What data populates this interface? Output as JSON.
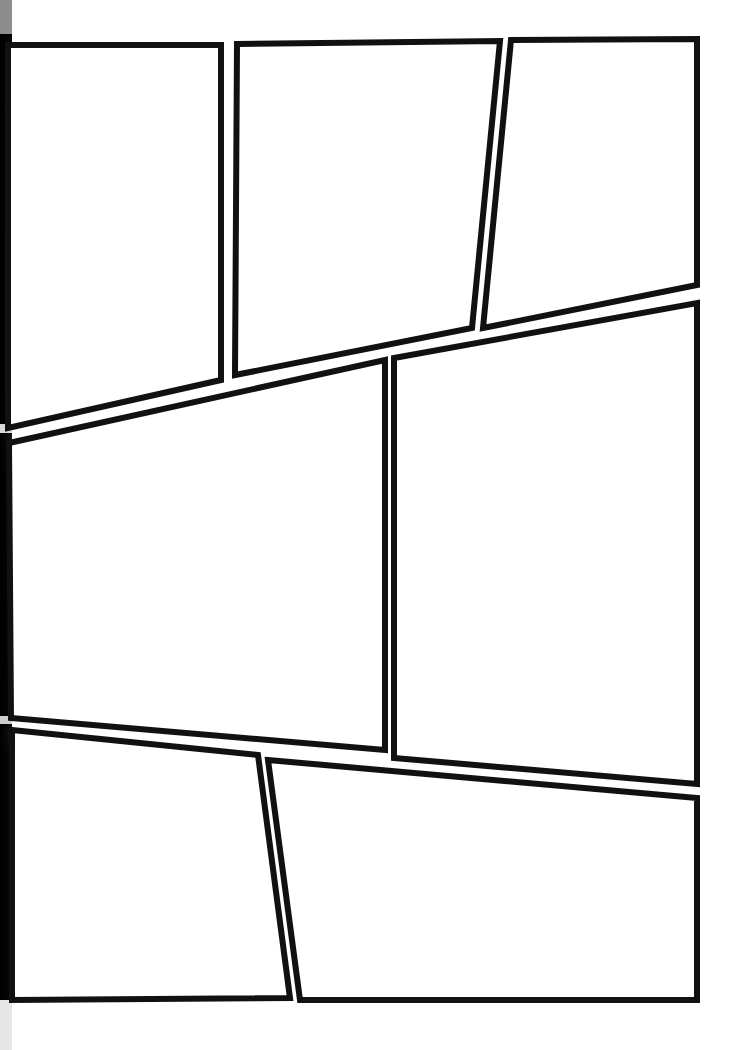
{
  "document": {
    "kind": "comic-page-template",
    "title": "Blank Comic Page Layout",
    "page_width": 744,
    "page_height": 1050,
    "background_color": "#ffffff",
    "ink_color": "#111111",
    "border_width": 6,
    "has_visible_text": false
  },
  "binding": {
    "name": "book-spine-shadow",
    "edge": "left",
    "x": 0,
    "width": 12,
    "top_color": "#0a0a0a",
    "bottom_color": "#1a1a1a"
  },
  "layout": {
    "tiers": 3,
    "panel_count": 7,
    "tier_labels": [
      "top-tier",
      "middle-tier",
      "bottom-tier"
    ]
  },
  "panels": [
    {
      "id": "panel-1",
      "label": "Panel 1",
      "tier": "top-tier",
      "order": 1,
      "points": "8,45 221,45 221,380 8,428"
    },
    {
      "id": "panel-2",
      "label": "Panel 2",
      "tier": "top-tier",
      "order": 2,
      "points": "237,44 500,41 472,328 235,375"
    },
    {
      "id": "panel-3",
      "label": "Panel 3",
      "tier": "top-tier",
      "order": 3,
      "points": "511,40 697,39 697,285 483,328"
    },
    {
      "id": "panel-4",
      "label": "Panel 4",
      "tier": "middle-tier",
      "order": 4,
      "points": "9,443 385,360 385,750 11,718"
    },
    {
      "id": "panel-5",
      "label": "Panel 5",
      "tier": "middle-tier",
      "order": 5,
      "points": "394,358 697,303 697,784 394,758"
    },
    {
      "id": "panel-6",
      "label": "Panel 6",
      "tier": "bottom-tier",
      "order": 6,
      "points": "12,730 258,755 290,998 12,1000"
    },
    {
      "id": "panel-7",
      "label": "Panel 7",
      "tier": "bottom-tier",
      "order": 7,
      "points": "268,760 697,798 697,1000 300,1000"
    }
  ]
}
